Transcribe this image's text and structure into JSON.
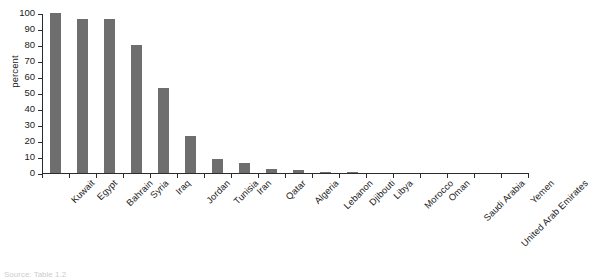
{
  "chart_data": {
    "type": "bar",
    "title": "",
    "xlabel": "",
    "ylabel": "percent",
    "ylim": [
      0,
      100
    ],
    "ytick_values": [
      0,
      10,
      20,
      30,
      40,
      50,
      60,
      70,
      80,
      90,
      100
    ],
    "ytick_labels": [
      "0",
      "10",
      "20",
      "30",
      "40",
      "50",
      "60",
      "70",
      "80",
      "90",
      "100"
    ],
    "grid": false,
    "legend": null,
    "bar_color": "#6e6e6e",
    "axis_color": "#2b2b2b",
    "categories": [
      "Kuwait",
      "Egypt",
      "Bahrain",
      "Syria",
      "Iraq",
      "Jordan",
      "Tunisia",
      "Iran",
      "Qatar",
      "Algeria",
      "Lebanon",
      "Djibouti",
      "Libya",
      "Morocco",
      "Oman",
      "Saudi Arabia",
      "United Arab Emirates",
      "Yemen"
    ],
    "values": [
      100,
      96.5,
      96,
      80,
      53,
      23,
      8.5,
      6.5,
      2.5,
      2,
      0.5,
      0.3,
      0,
      0,
      0,
      0,
      0,
      0
    ]
  },
  "caption": {
    "text": "Source: Table 1.2"
  }
}
